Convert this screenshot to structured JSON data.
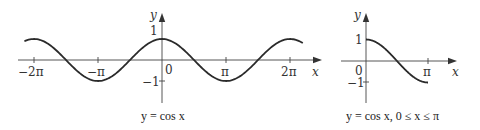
{
  "chart_data": [
    {
      "type": "line",
      "title": "y = cos x",
      "caption": "y = cos x",
      "xlabel": "x",
      "ylabel": "y",
      "x_ticks": [
        "−2π",
        "−π",
        "π",
        "2π"
      ],
      "y_ticks": [
        "1",
        "−1"
      ],
      "origin_label": "0",
      "xlim": [
        -2.35,
        2.2
      ],
      "xlim_units": "π",
      "ylim": [
        -1,
        1
      ],
      "function": "cos(x)",
      "domain": [
        -2.15,
        2.2
      ],
      "series": [
        {
          "name": "cos x",
          "x": [
            -6.76,
            -6.283,
            -4.712,
            -3.142,
            -1.571,
            0,
            1.571,
            3.142,
            4.712,
            6.283,
            6.91
          ],
          "values": [
            0.88,
            1,
            0,
            -1,
            0,
            1,
            0,
            -1,
            0,
            1,
            0.81
          ]
        }
      ],
      "grid": false
    },
    {
      "type": "line",
      "title": "y = cos x, 0 ≤ x ≤ π",
      "caption": "y = cos x, 0 ≤ x ≤ π",
      "xlabel": "x",
      "ylabel": "y",
      "x_ticks": [
        "π"
      ],
      "y_ticks": [
        "1",
        "−1"
      ],
      "origin_label": "0",
      "domain": [
        0,
        3.142
      ],
      "ylim": [
        -1,
        1
      ],
      "function": "cos(x)",
      "series": [
        {
          "name": "cos x",
          "x": [
            0,
            0.785,
            1.571,
            2.356,
            3.142
          ],
          "values": [
            1,
            0.707,
            0,
            -0.707,
            -1
          ]
        }
      ],
      "grid": false
    }
  ],
  "left": {
    "ylabel": "y",
    "xlabel": "x",
    "tick_neg2pi": "−2π",
    "tick_negpi": "−π",
    "tick_pi": "π",
    "tick_2pi": "2π",
    "tick_one": "1",
    "tick_neg_one": "−1",
    "origin": "0",
    "caption": "y = cos x"
  },
  "right": {
    "ylabel": "y",
    "xlabel": "x",
    "tick_pi": "π",
    "tick_one": "1",
    "tick_neg_one": "−1",
    "origin": "0",
    "caption": "y = cos x,  0 ≤ x ≤ π"
  }
}
